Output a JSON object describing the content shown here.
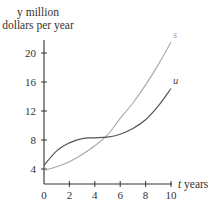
{
  "chart_data": {
    "type": "line",
    "title": "",
    "xlabel": "t years",
    "ylabel": "y million dollars per year",
    "ylabel_lines": [
      "y million",
      "dollars per year"
    ],
    "xlabel_var": "t",
    "xlabel_unit": "years",
    "x_ticks": [
      0,
      2,
      4,
      6,
      8,
      10
    ],
    "y_ticks": [
      4,
      8,
      12,
      16,
      20
    ],
    "xlim": [
      0,
      10
    ],
    "ylim": [
      2,
      22
    ],
    "grid": false,
    "legend": "inline labels at curve ends",
    "x": [
      0,
      1,
      2,
      3,
      4,
      5,
      6,
      7,
      8,
      9,
      10
    ],
    "series": [
      {
        "name": "s",
        "color": "#a8a8a8",
        "values": [
          3.8,
          4.3,
          5.0,
          6.0,
          7.2,
          8.7,
          11.0,
          13.1,
          15.6,
          18.4,
          21.5
        ]
      },
      {
        "name": "u",
        "color": "#555555",
        "values": [
          4.5,
          6.5,
          7.6,
          8.2,
          8.3,
          8.4,
          8.8,
          9.6,
          10.8,
          12.7,
          15.1
        ]
      }
    ],
    "annotations": [
      {
        "text": "s",
        "at": {
          "t": 10,
          "y": 21.5
        }
      },
      {
        "text": "u",
        "at": {
          "t": 10,
          "y": 15.1
        }
      }
    ]
  },
  "axes": {
    "y_title_line1": "y million",
    "y_title_line2": "dollars per year",
    "x_title_var": "t",
    "x_title_unit": " years",
    "x_tick_labels": [
      "0",
      "2",
      "4",
      "6",
      "8",
      "10"
    ],
    "y_tick_labels": [
      "4",
      "8",
      "12",
      "16",
      "20"
    ]
  },
  "labels": {
    "s": "s",
    "u": "u"
  }
}
